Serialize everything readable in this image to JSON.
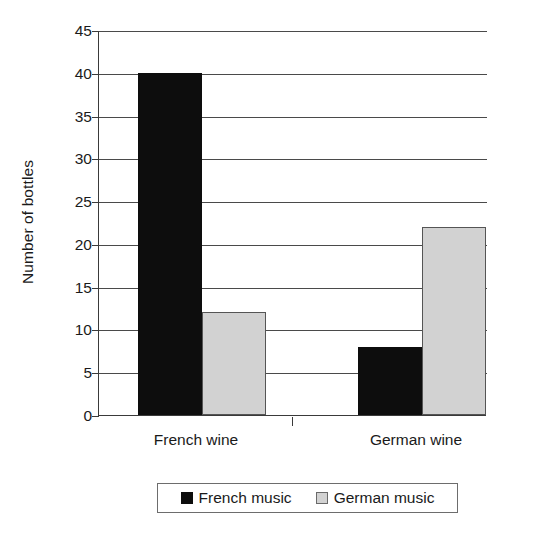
{
  "chart_data": {
    "type": "bar",
    "title": "",
    "xlabel": "",
    "ylabel": "Number of bottles",
    "categories": [
      "French wine",
      "German wine"
    ],
    "series": [
      {
        "name": "French music",
        "color": "#0d0d0d",
        "values": [
          40,
          8
        ]
      },
      {
        "name": "German music",
        "color": "#d2d2d2",
        "values": [
          12,
          22
        ]
      }
    ],
    "ylim": [
      0,
      45
    ],
    "y_ticks": [
      0,
      5,
      10,
      15,
      20,
      25,
      30,
      35,
      40,
      45
    ],
    "y_tick_labels": [
      "0",
      "5",
      "10",
      "15",
      "20",
      "25",
      "30",
      "35",
      "40",
      "45"
    ],
    "grid": true,
    "grid_axis": "y",
    "legend_position": "bottom"
  },
  "legend": {
    "entries": [
      {
        "label": "French music",
        "swatch": "dark"
      },
      {
        "label": "German music",
        "swatch": "light"
      }
    ]
  },
  "axis": {
    "y_title": "Number of bottles"
  }
}
